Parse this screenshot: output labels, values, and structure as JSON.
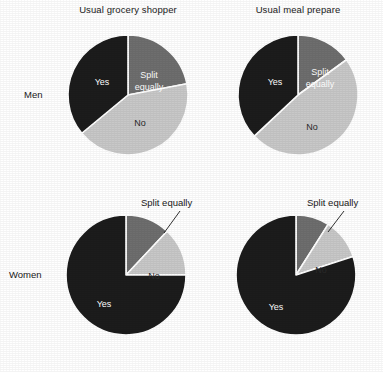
{
  "figure": {
    "column_titles": [
      "Usual grocery shopper",
      "Usual meal prepare"
    ],
    "row_labels": [
      "Men",
      "Women"
    ],
    "callout_label": "Split equally"
  },
  "colors": {
    "yes": "#1c1c1c",
    "split_equally": "#6e6e6e",
    "no": "#c8c8c8",
    "separator": "#ffffff",
    "text": "#1a1a1a",
    "background": "#ffffff"
  },
  "chart_data": [
    {
      "type": "pie",
      "title": "Usual grocery shopper",
      "group": "Men",
      "labels": [
        "Split equally",
        "No",
        "Yes"
      ],
      "values": [
        22,
        42,
        36
      ],
      "colors": [
        "#6e6e6e",
        "#c8c8c8",
        "#1c1c1c"
      ],
      "start_angle_deg": 0,
      "direction": "clockwise",
      "labels_inside": true,
      "legend": "none"
    },
    {
      "type": "pie",
      "title": "Usual meal prepare",
      "group": "Men",
      "labels": [
        "Split equally",
        "No",
        "Yes"
      ],
      "values": [
        15,
        48,
        37
      ],
      "colors": [
        "#6e6e6e",
        "#c8c8c8",
        "#1c1c1c"
      ],
      "start_angle_deg": 0,
      "direction": "clockwise",
      "labels_inside": true,
      "legend": "none"
    },
    {
      "type": "pie",
      "title": "Usual grocery shopper",
      "group": "Women",
      "labels": [
        "Split equally",
        "No",
        "Yes"
      ],
      "values": [
        12,
        13,
        75
      ],
      "colors": [
        "#6e6e6e",
        "#c8c8c8",
        "#1c1c1c"
      ],
      "start_angle_deg": 0,
      "direction": "clockwise",
      "labels_inside": false,
      "legend": "none"
    },
    {
      "type": "pie",
      "title": "Usual meal prepare",
      "group": "Women",
      "labels": [
        "Split equally",
        "No",
        "Yes"
      ],
      "values": [
        9,
        11,
        80
      ],
      "colors": [
        "#6e6e6e",
        "#c8c8c8",
        "#1c1c1c"
      ],
      "start_angle_deg": 0,
      "direction": "clockwise",
      "labels_inside": false,
      "legend": "none"
    }
  ],
  "pies": [
    {
      "id": "men-grocery",
      "slice_labels": {
        "split_line1": "Split",
        "split_line2": "equally",
        "no": "No",
        "yes": "Yes"
      }
    },
    {
      "id": "men-meal",
      "slice_labels": {
        "split_line1": "Split",
        "split_line2": "equally",
        "no": "No",
        "yes": "Yes"
      }
    },
    {
      "id": "women-grocery",
      "slice_labels": {
        "no": "No",
        "yes": "Yes",
        "callout": "Split equally"
      }
    },
    {
      "id": "women-meal",
      "slice_labels": {
        "no": "No",
        "yes": "Yes",
        "callout": "Split equally"
      }
    }
  ]
}
